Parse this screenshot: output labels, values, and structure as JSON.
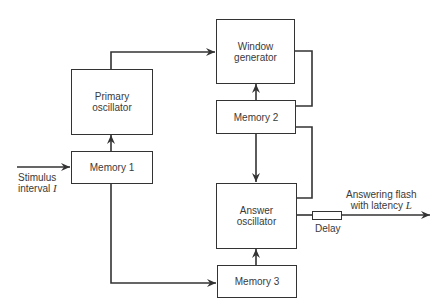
{
  "blocks": {
    "primary_oscillator": {
      "line1": "Primary",
      "line2": "oscillator"
    },
    "memory1": {
      "label": "Memory 1"
    },
    "window_generator": {
      "line1": "Window",
      "line2": "generator"
    },
    "memory2": {
      "label": "Memory 2"
    },
    "answer_oscillator": {
      "line1": "Answer",
      "line2": "oscillator"
    },
    "memory3": {
      "label": "Memory 3"
    },
    "delay": {
      "label": "Delay"
    }
  },
  "input": {
    "line1": "Stimulus",
    "line2_text": "interval ",
    "variable": "I"
  },
  "output": {
    "line1": "Answering flash",
    "line2_text": "with latency ",
    "variable": "L"
  },
  "colors": {
    "line": "#333333",
    "text": "#3a3a3a",
    "background": "#ffffff"
  }
}
